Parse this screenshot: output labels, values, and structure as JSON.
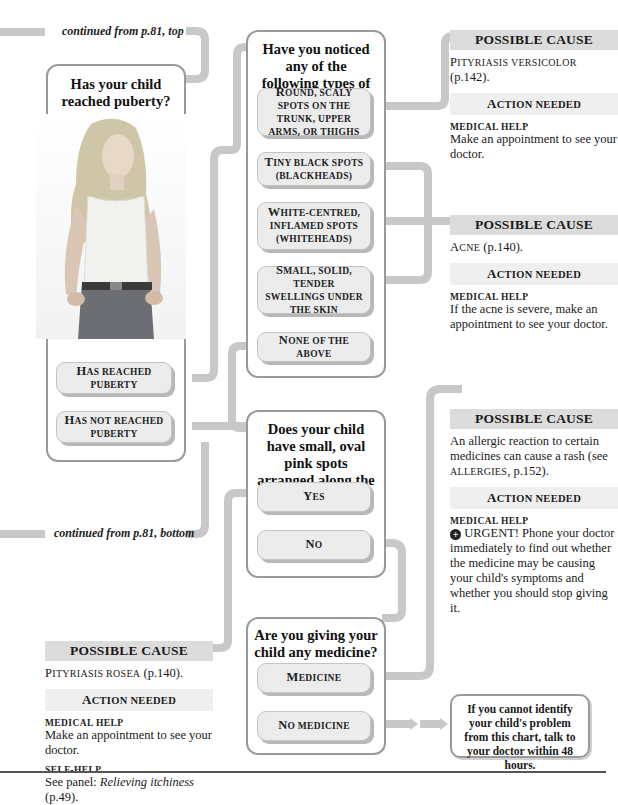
{
  "continuations": {
    "top": "continued from p.81, top",
    "bottom": "continued from p.81, bottom"
  },
  "question_puberty": {
    "title": "Has your child reached puberty?",
    "image": "teenage-girl-photo",
    "options": [
      {
        "cap": "H",
        "rest": "as reached puberty"
      },
      {
        "cap": "H",
        "rest": "as not reached puberty"
      }
    ]
  },
  "question_spots": {
    "title": "Have you noticed any of the following types of spots?",
    "options": [
      {
        "cap": "R",
        "rest": "ound, scaly spots on the trunk, upper arms, or thighs"
      },
      {
        "cap": "T",
        "rest": "iny black spots (blackheads)"
      },
      {
        "cap": "W",
        "rest": "hite-centred, inflamed spots (whiteheads)"
      },
      {
        "cap": "S",
        "rest": "mall, solid, tender swellings under the skin"
      },
      {
        "cap": "N",
        "rest": "one of the above"
      }
    ]
  },
  "question_ribs": {
    "title": "Does your child have small, oval pink spots arranged along the lines of the ribs?",
    "options": [
      {
        "cap": "Y",
        "rest": "es"
      },
      {
        "cap": "N",
        "rest": "o"
      }
    ]
  },
  "question_medicine": {
    "title": "Are you giving your child any medicine?",
    "options": [
      {
        "cap": "M",
        "rest": "edicine"
      },
      {
        "cap": "N",
        "rest": "o medicine"
      }
    ]
  },
  "causes": [
    {
      "heading": "POSSIBLE CAUSE",
      "cause_cap": "P",
      "cause_rest": "ityriasis versicolor",
      "cause_ref": " (p.142).",
      "action_heading_cap": "A",
      "action_heading_rest": "ction needed",
      "help": [
        {
          "label": "Medical help",
          "text": "Make an appointment to see your doctor."
        }
      ]
    },
    {
      "heading": "POSSIBLE CAUSE",
      "cause_cap": "A",
      "cause_rest": "cne",
      "cause_ref": " (p.140).",
      "action_heading_cap": "A",
      "action_heading_rest": "ction needed",
      "help": [
        {
          "label": "Medical help",
          "text": "If the acne is severe, make an appointment to see your doctor."
        }
      ]
    },
    {
      "heading": "POSSIBLE CAUSE",
      "cause_pre": "An allergic reaction to certain medicines can cause a rash (see ",
      "cause_sc": "allergies",
      "cause_post": ", p.152).",
      "action_heading_cap": "A",
      "action_heading_rest": "ction needed",
      "help": [
        {
          "label": "Medical help",
          "icon": "urgent-cross-icon",
          "text": "URGENT! Phone your doctor immediately to find out whether the medicine may be causing your child's symptoms and whether you should stop giving it."
        }
      ]
    },
    {
      "heading": "POSSIBLE CAUSE",
      "cause_cap": "P",
      "cause_rest": "ityriasis rosea",
      "cause_ref": " (p.140).",
      "action_heading_cap": "A",
      "action_heading_rest": "ction needed",
      "help": [
        {
          "label": "Medical help",
          "text": "Make an appointment to see your doctor."
        },
        {
          "label": "Self-help",
          "text_pre": "See panel: ",
          "text_italic": "Relieving itchiness",
          "text_post": " (p.49)."
        }
      ]
    }
  ],
  "final_note": "If you cannot identify your child's problem from this chart, talk to your doctor within 48 hours.",
  "colors": {
    "connector": "#c8c8c8",
    "box_border": "#9a9a9a",
    "option_fill": "#ececec",
    "cause_header": "#dcdcdc",
    "action_header": "#efefef"
  }
}
